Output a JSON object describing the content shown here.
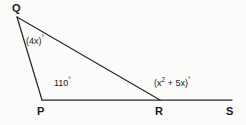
{
  "figure": {
    "type": "geometry-diagram",
    "background_color": "#fbfbfa",
    "line_color": "#2b2b2b",
    "text_color": "#1a1a1a",
    "vertices": [
      {
        "id": "Q",
        "label": "Q",
        "x": 17,
        "y": 17
      },
      {
        "id": "P",
        "label": "P",
        "x": 42,
        "y": 100
      },
      {
        "id": "R",
        "label": "R",
        "x": 160,
        "y": 100
      },
      {
        "id": "S",
        "label": "S",
        "x": 232,
        "y": 100
      }
    ],
    "segments": [
      {
        "name": "QP",
        "from": "Q",
        "to": "P"
      },
      {
        "name": "QR",
        "from": "Q",
        "to": "R"
      },
      {
        "name": "PS",
        "from": "P",
        "to": "S"
      }
    ],
    "angles": {
      "at_q": {
        "text": "(4x)",
        "degree_symbol": "°"
      },
      "at_p": {
        "text": "110",
        "degree_symbol": "°"
      },
      "at_r_exterior": {
        "prefix": "(x",
        "exponent": "2",
        "middle": " + 5x)",
        "degree_symbol": "°"
      }
    },
    "bleed_text": "​"
  }
}
